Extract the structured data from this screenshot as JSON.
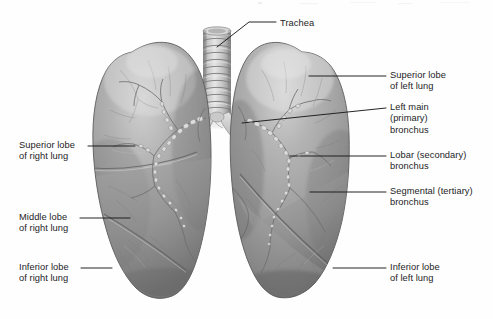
{
  "figure": {
    "background_color": "#fefefe",
    "label_color": "#1d1d1f",
    "leader_line_color": "#1a1a1a",
    "tissue_color": "#9a9a9a",
    "tissue_shadow_color": "#6d6d6d",
    "tissue_highlight_color": "#cfcfcf",
    "trachea_color": "#c8c8c8",
    "bronchus_color": "#d8d8d8"
  },
  "labels": [
    {
      "id": "trachea",
      "text": "Trachea",
      "lines": [
        "Trachea"
      ],
      "side": "top",
      "text_x": 280,
      "text_y": 18,
      "leader": [
        [
          276,
          22
        ],
        [
          249,
          22
        ],
        [
          217,
          47
        ]
      ]
    },
    {
      "id": "superior-lobe-left-lung",
      "text": "Superior lobe of left lung",
      "lines": [
        "Superior lobe",
        "of left lung"
      ],
      "side": "right",
      "text_x": 390,
      "text_y": 70,
      "leader": [
        [
          386,
          76
        ],
        [
          309,
          76
        ]
      ]
    },
    {
      "id": "left-main-primary-bronchus",
      "text": "Left main (primary) bronchus",
      "lines": [
        "Left main",
        "(primary)",
        "bronchus"
      ],
      "side": "right",
      "text_x": 390,
      "text_y": 102,
      "leader": [
        [
          386,
          108
        ],
        [
          242,
          123
        ]
      ]
    },
    {
      "id": "lobar-secondary-bronchus",
      "text": "Lobar (secondary) bronchus",
      "lines": [
        "Lobar (secondary)",
        "bronchus"
      ],
      "side": "right",
      "text_x": 390,
      "text_y": 150,
      "leader": [
        [
          386,
          156
        ],
        [
          290,
          156
        ]
      ]
    },
    {
      "id": "segmental-tertiary-bronchus",
      "text": "Segmental (tertiary) bronchus",
      "lines": [
        "Segmental (tertiary)",
        "bronchus"
      ],
      "side": "right",
      "text_x": 390,
      "text_y": 186,
      "leader": [
        [
          386,
          192
        ],
        [
          310,
          192
        ]
      ]
    },
    {
      "id": "inferior-lobe-left-lung",
      "text": "Inferior lobe of left lung",
      "lines": [
        "Inferior lobe",
        "of left lung"
      ],
      "side": "right",
      "text_x": 390,
      "text_y": 262,
      "leader": [
        [
          386,
          268
        ],
        [
          333,
          268
        ]
      ]
    },
    {
      "id": "superior-lobe-right-lung",
      "text": "Superior lobe of right lung",
      "lines": [
        "Superior lobe",
        "of right lung"
      ],
      "side": "left",
      "text_x": 19,
      "text_y": 140,
      "leader": [
        [
          88,
          146
        ],
        [
          135,
          146
        ]
      ]
    },
    {
      "id": "middle-lobe-right-lung",
      "text": "Middle lobe of right lung",
      "lines": [
        "Middle lobe",
        "of right lung"
      ],
      "side": "left",
      "text_x": 19,
      "text_y": 212,
      "leader": [
        [
          80,
          218
        ],
        [
          130,
          218
        ]
      ]
    },
    {
      "id": "inferior-lobe-right-lung",
      "text": "Inferior lobe of right lung",
      "lines": [
        "Inferior lobe",
        "of right lung"
      ],
      "side": "left",
      "text_x": 19,
      "text_y": 262,
      "leader": [
        [
          81,
          268
        ],
        [
          112,
          268
        ]
      ]
    }
  ],
  "anatomy": {
    "trachea": {
      "name": "trachea",
      "ring_count": 12,
      "top_y": 30,
      "bottom_y": 118,
      "center_x": 217
    },
    "right_lung": {
      "name": "right lung",
      "lobes": [
        "Superior lobe",
        "Middle lobe",
        "Inferior lobe"
      ],
      "lobe_count": 3
    },
    "left_lung": {
      "name": "left lung",
      "lobes": [
        "Superior lobe",
        "Inferior lobe"
      ],
      "lobe_count": 2
    }
  }
}
